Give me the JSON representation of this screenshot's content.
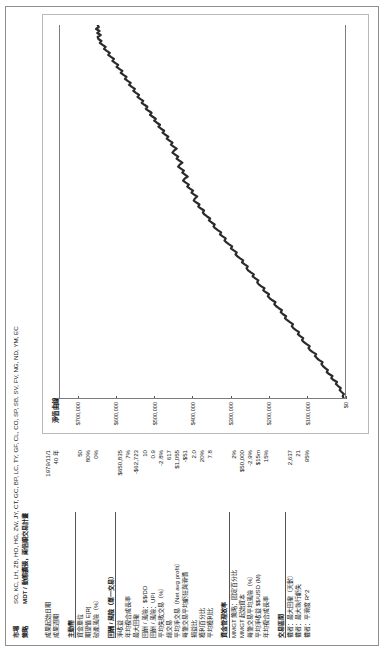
{
  "header": {
    "market_label": "市場",
    "market_value": "SO, KC, LH, ZB, HO, HG, ZW, JY, CT, GC, BP, LC, TY, GF, CL, CO, SP, SB, SV, FV, NG, ND, YM, EC",
    "system_label": "策略",
    "system_value": "MDT / 動態擴張，兩倍順交易計畫"
  },
  "stats": [
    {
      "label": "成果起始日期",
      "value": "1979/11/1"
    },
    {
      "label": "成果週期",
      "value": "40 年"
    },
    {
      "label": "",
      "value": "",
      "spacer": true
    },
    {
      "label": "主動幣",
      "value": "",
      "section": true
    },
    {
      "label": "資金單位",
      "value": "50"
    },
    {
      "label": "期望值 E[R]",
      "value": "80%"
    },
    {
      "label": "破產風險（%）",
      "value": "0%"
    },
    {
      "label": "",
      "value": "",
      "spacer": true
    },
    {
      "label": "回酬 / 風險（單一交易）",
      "value": "",
      "section": true
    },
    {
      "label": "淨收益",
      "value": "$650,835"
    },
    {
      "label": "年均複合成長率",
      "value": "7%"
    },
    {
      "label": "最大回撤",
      "value": "-$62,723"
    },
    {
      "label": "回酬 / 風險：$$/DD",
      "value": "10"
    },
    {
      "label": "回酬 / 風險：UPI",
      "value": "0.9"
    },
    {
      "label": "平均失敗交易（%）",
      "value": "-2.8%"
    },
    {
      "label": "總交易",
      "value": "617"
    },
    {
      "label": "平均淨交易（Net avg profit）",
      "value": "$1,055"
    },
    {
      "label": "每筆交易平均虧狂與滑價",
      "value": "-$51"
    },
    {
      "label": "損益比",
      "value": "2.0"
    },
    {
      "label": "獲利百分比",
      "value": "20%"
    },
    {
      "label": "平均獲利比",
      "value": "7.8"
    },
    {
      "label": "",
      "value": "",
      "spacer": true
    },
    {
      "label": "資金管理效率",
      "value": "",
      "section": true
    },
    {
      "label": "MMGT 策略：固定百分比",
      "value": "2%"
    },
    {
      "label": "MMGT 起始資本",
      "value": "$50,000"
    },
    {
      "label": "每筆交易平均風險（%）",
      "value": "-2.9%"
    },
    {
      "label": "平均淨收益 $$/USD (M)",
      "value": "$15m"
    },
    {
      "label": "年均複合成長率",
      "value": "15%"
    },
    {
      "label": "",
      "value": "",
      "spacer": true
    },
    {
      "label": "交易區間",
      "value": "",
      "section": true
    },
    {
      "label": "權者：最大回撤（天數）",
      "value": "2,637"
    },
    {
      "label": "權者：最大執行虧失",
      "value": "21"
    },
    {
      "label": "權者：平滑度 R^2",
      "value": "95%"
    }
  ],
  "chart_data": {
    "type": "line",
    "title": "淨值曲線",
    "xlabel": "",
    "ylabel": "",
    "ylim": [
      0,
      750000
    ],
    "grid": false,
    "legend": "none",
    "yticks": [
      0,
      100000,
      200000,
      300000,
      400000,
      500000,
      600000,
      700000
    ],
    "ytick_labels": [
      "$0",
      "$100,000",
      "$200,000",
      "$300,000",
      "$400,000",
      "$500,000",
      "$600,000",
      "$700,000"
    ],
    "series": [
      {
        "name": "淨值曲線",
        "values": [
          4000,
          6000,
          3000,
          9000,
          14000,
          11000,
          18000,
          24000,
          21000,
          30000,
          36000,
          33000,
          42000,
          48000,
          45000,
          52000,
          58000,
          62000,
          59000,
          68000,
          74000,
          79000,
          76000,
          85000,
          92000,
          96000,
          93000,
          101000,
          108000,
          113000,
          110000,
          118000,
          124000,
          121000,
          129000,
          136000,
          140000,
          137000,
          145000,
          152000,
          158000,
          155000,
          163000,
          169000,
          166000,
          174000,
          181000,
          186000,
          183000,
          191000,
          198000,
          203000,
          200000,
          208000,
          215000,
          212000,
          220000,
          227000,
          231000,
          228000,
          236000,
          243000,
          240000,
          248000,
          255000,
          259000,
          256000,
          264000,
          271000,
          268000,
          276000,
          283000,
          288000,
          285000,
          293000,
          300000,
          297000,
          305000,
          312000,
          317000,
          314000,
          322000,
          329000,
          326000,
          334000,
          341000,
          346000,
          343000,
          351000,
          358000,
          355000,
          363000,
          370000,
          374000,
          371000,
          379000,
          386000,
          383000,
          391000,
          398000,
          395000,
          389000,
          397000,
          404000,
          400000,
          408000,
          415000,
          411000,
          419000,
          426000,
          422000,
          414000,
          421000,
          428000,
          424000,
          432000,
          439000,
          435000,
          428000,
          436000,
          443000,
          439000,
          447000,
          454000,
          450000,
          443000,
          451000,
          458000,
          454000,
          462000,
          469000,
          465000,
          473000,
          480000,
          476000,
          484000,
          491000,
          487000,
          495000,
          502000,
          498000,
          506000,
          513000,
          509000,
          517000,
          524000,
          520000,
          528000,
          535000,
          531000,
          539000,
          546000,
          542000,
          550000,
          557000,
          553000,
          561000,
          568000,
          564000,
          572000,
          579000,
          575000,
          583000,
          590000,
          586000,
          594000,
          601000,
          597000,
          605000,
          612000,
          608000,
          616000,
          623000,
          619000,
          627000,
          634000,
          630000,
          638000,
          645000,
          641000,
          649000,
          651000,
          643000,
          652000,
          646000,
          655000,
          648000,
          650835
        ]
      }
    ]
  }
}
